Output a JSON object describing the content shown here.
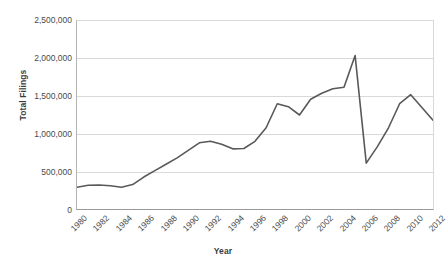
{
  "chart_data": {
    "type": "line",
    "title": "",
    "xlabel": "Year",
    "ylabel": "Total Filings",
    "xlim": [
      1980,
      2012
    ],
    "ylim": [
      0,
      2500000
    ],
    "grid": true,
    "legend": "none",
    "line_color": "#595959",
    "gridline_color": "#d9d9d9",
    "axis_color": "#9a9a9a",
    "y_ticks": [
      "2,500,000",
      "2,000,000",
      "1,500,000",
      "1,000,000",
      "500,000",
      "0"
    ],
    "y_tick_values": [
      2500000,
      2000000,
      1500000,
      1000000,
      500000,
      0
    ],
    "x_ticks": [
      "1980",
      "1982",
      "1984",
      "1986",
      "1988",
      "1990",
      "1992",
      "1994",
      "1996",
      "1998",
      "2000",
      "2002",
      "2004",
      "2006",
      "2008",
      "2010",
      "2012"
    ],
    "x": [
      1980,
      1981,
      1982,
      1983,
      1984,
      1985,
      1986,
      1987,
      1988,
      1989,
      1990,
      1991,
      1992,
      1993,
      1994,
      1995,
      1996,
      1997,
      1998,
      1999,
      2000,
      2001,
      2002,
      2003,
      2004,
      2005,
      2006,
      2007,
      2008,
      2009,
      2010,
      2011,
      2012
    ],
    "values": [
      290000,
      315000,
      320000,
      310000,
      290000,
      325000,
      425000,
      510000,
      595000,
      680000,
      780000,
      880000,
      900000,
      860000,
      800000,
      805000,
      900000,
      1080000,
      1400000,
      1360000,
      1250000,
      1460000,
      1540000,
      1600000,
      1620000,
      2040000,
      610000,
      830000,
      1080000,
      1400000,
      1520000,
      1350000,
      1180000
    ]
  }
}
